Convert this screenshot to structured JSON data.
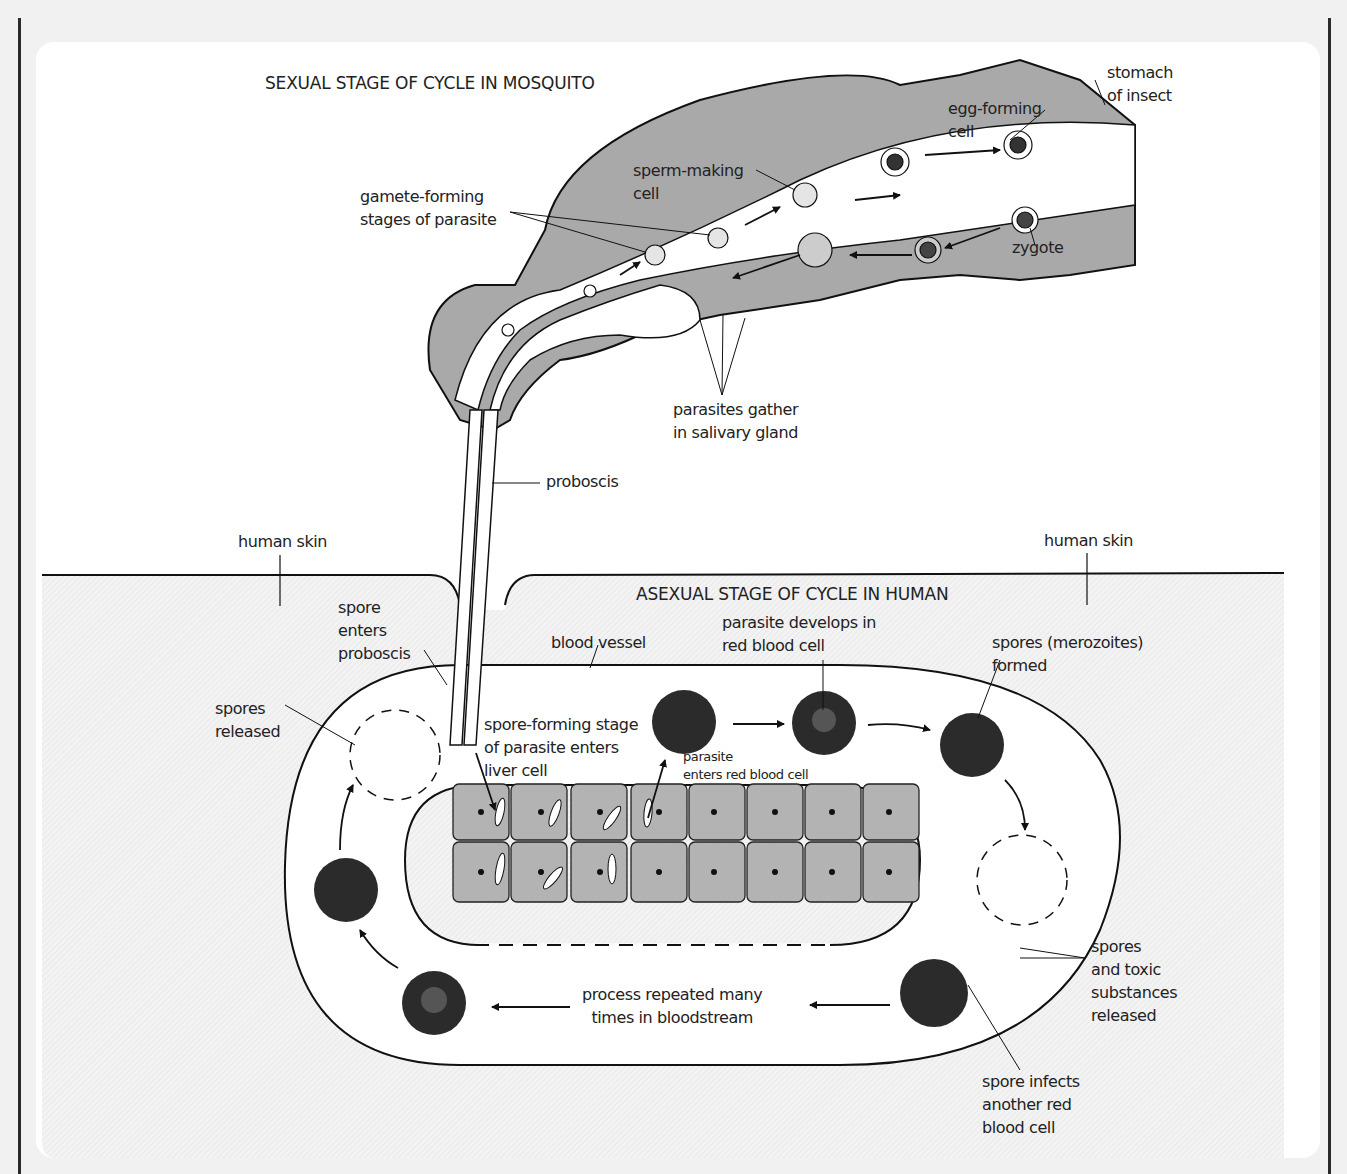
{
  "diagram": {
    "sections": {
      "mosquito": {
        "title": "SEXUAL STAGE OF CYCLE IN MOSQUITO"
      },
      "human": {
        "title": "ASEXUAL STAGE OF CYCLE IN HUMAN"
      }
    },
    "labels": {
      "stomach": "stomach\nof insect",
      "egg_cell": "egg-forming\ncell",
      "sperm_cell": "sperm-making\ncell",
      "gamete": "gamete-forming\nstages of parasite",
      "zygote": "zygote",
      "salivary": "parasites gather\nin salivary gland",
      "proboscis": "proboscis",
      "skin_left": "human skin",
      "skin_right": "human skin",
      "spore_enters": "spore\nenters\nproboscis",
      "blood_vessel": "blood vessel",
      "spores_released": "spores\nreleased",
      "liver_entry": "spore-forming stage\nof parasite enters\nliver cell",
      "parasite_enters_rbc": "parasite\nenters red blood cell",
      "parasite_develops": "parasite develops in\nred blood cell",
      "merozoites": "spores (merozoites)\nformed",
      "toxic": "spores\nand toxic\nsubstances\nreleased",
      "process_repeated": "process repeated many\ntimes in bloodstream",
      "spore_infects": "spore infects\nanother red\nblood cell"
    },
    "colors": {
      "tissue_gray": "#a9a9a9",
      "liver_gray": "#b3b3b3",
      "rbc_dark": "#2b2b2b",
      "outline": "#1a1a1a",
      "background_stripe": "#f1f1f1"
    }
  }
}
